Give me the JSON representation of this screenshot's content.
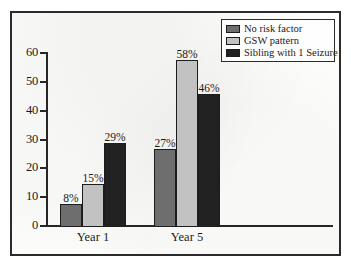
{
  "chart_data": {
    "type": "bar",
    "title": "",
    "subtitle": "",
    "xlabel": "",
    "ylabel": "",
    "categories": [
      "Year 1",
      "Year 5"
    ],
    "series": [
      {
        "name": "No risk factor",
        "values": [
          8,
          27
        ],
        "labels": [
          "8%",
          "27%"
        ],
        "color": "#6e6e6e"
      },
      {
        "name": "GSW pattern",
        "values": [
          15,
          58
        ],
        "labels": [
          "15%",
          "58%"
        ],
        "color": "#c2c2c2"
      },
      {
        "name": "Sibling with 1 Seizure",
        "values": [
          29,
          46
        ],
        "labels": [
          "29%",
          "46%"
        ],
        "color": "#212121"
      }
    ],
    "ylim": [
      0,
      60
    ],
    "yticks": [
      0,
      10,
      20,
      30,
      40,
      50,
      60
    ],
    "ytick_labels": [
      "0",
      "10",
      "20",
      "30",
      "40",
      "50",
      "60"
    ],
    "grid": false,
    "legend_position": "top-right",
    "value_labels_shown": true
  },
  "legend": {
    "entries": [
      {
        "label": "No risk factor"
      },
      {
        "label": "GSW pattern"
      },
      {
        "label": "Sibling with 1 Seizure"
      }
    ]
  }
}
